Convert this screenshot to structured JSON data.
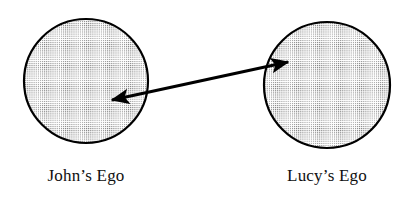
{
  "canvas": {
    "width": 416,
    "height": 201,
    "background_color": "#ffffff"
  },
  "diagram": {
    "type": "ego-relationship-diagram",
    "stroke_color": "#000000",
    "fill_pattern": "dot-stipple",
    "fill_dot_color": "#808080",
    "fill_base_color": "#ffffff",
    "nodes": [
      {
        "id": "john-ego",
        "shape": "circle",
        "label": "John’s Ego",
        "cx": 86,
        "cy": 81,
        "r": 62,
        "stroke_width": 2
      },
      {
        "id": "lucy-ego",
        "shape": "circle",
        "label": "Lucy’s Ego",
        "cx": 327,
        "cy": 85,
        "r": 63,
        "stroke_width": 2
      }
    ],
    "connector": {
      "id": "ego-connector",
      "style": "double-headed-arrow",
      "from_x": 112,
      "from_y": 100,
      "to_x": 288,
      "to_y": 62,
      "shaft_width": 3,
      "arrowhead_length": 17,
      "arrowhead_width": 13,
      "color": "#000000"
    }
  }
}
